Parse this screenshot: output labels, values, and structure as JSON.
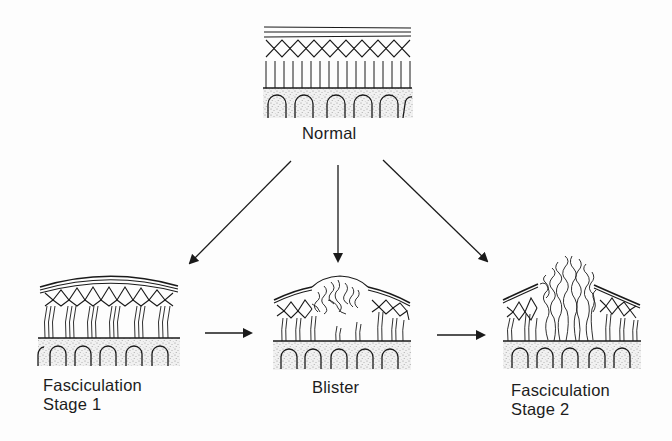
{
  "diagram": {
    "colors": {
      "ink": "#1a1a1a",
      "stipple": "#9a9a9a",
      "background": "#fdfdfd"
    },
    "nodes": [
      {
        "id": "normal",
        "label_lines": [
          "Normal"
        ]
      },
      {
        "id": "stage1",
        "label_lines": [
          "Fasciculation",
          "Stage 1"
        ]
      },
      {
        "id": "blister",
        "label_lines": [
          "Blister"
        ]
      },
      {
        "id": "stage2",
        "label_lines": [
          "Fasciculation",
          "Stage 2"
        ]
      }
    ],
    "edges": [
      {
        "from": "normal",
        "to": "stage1"
      },
      {
        "from": "normal",
        "to": "blister"
      },
      {
        "from": "normal",
        "to": "stage2"
      },
      {
        "from": "stage1",
        "to": "blister"
      },
      {
        "from": "blister",
        "to": "stage2"
      }
    ]
  },
  "labels": {
    "normal": "Normal",
    "stage1_line1": "Fasciculation",
    "stage1_line2": "Stage 1",
    "blister": "Blister",
    "stage2_line1": "Fasciculation",
    "stage2_line2": "Stage 2"
  }
}
